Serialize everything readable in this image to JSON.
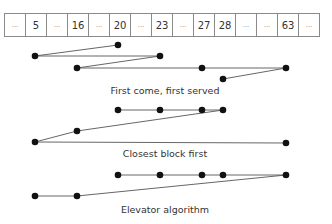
{
  "blocks": [
    "...",
    "5",
    "...",
    "16",
    "...",
    "20",
    "...",
    "23",
    "...",
    "27",
    "28",
    "...",
    "...",
    "63",
    "..."
  ],
  "block_x": {
    "5": 35,
    "16": 77,
    "20": 118,
    "23": 160,
    "27": 202,
    "28": 223,
    "63": 286
  },
  "diagrams": [
    {
      "label": "First come, first served",
      "label_y": 85,
      "sequence": [
        {
          "block": "20",
          "y": 45
        },
        {
          "block": "5",
          "y": 56
        },
        {
          "block": "23",
          "y": 56
        },
        {
          "block": "16",
          "y": 68
        },
        {
          "block": "27",
          "y": 68
        },
        {
          "block": "63",
          "y": 68
        },
        {
          "block": "28",
          "y": 79
        }
      ]
    },
    {
      "label": "Closest block first",
      "label_y": 148,
      "sequence": [
        {
          "block": "20",
          "y": 110
        },
        {
          "block": "23",
          "y": 110
        },
        {
          "block": "27",
          "y": 110
        },
        {
          "block": "28",
          "y": 110
        },
        {
          "block": "16",
          "y": 131
        },
        {
          "block": "5",
          "y": 142
        },
        {
          "block": "63",
          "y": 143
        }
      ]
    },
    {
      "label": "Elevator algorithm",
      "label_y": 204,
      "sequence": [
        {
          "block": "20",
          "y": 175
        },
        {
          "block": "23",
          "y": 175
        },
        {
          "block": "27",
          "y": 175
        },
        {
          "block": "28",
          "y": 175
        },
        {
          "block": "63",
          "y": 175
        },
        {
          "block": "16",
          "y": 196
        },
        {
          "block": "5",
          "y": 196
        }
      ]
    }
  ]
}
